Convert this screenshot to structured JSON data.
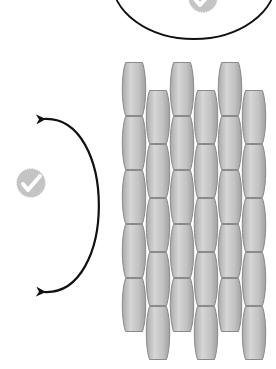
{
  "diagram": {
    "colors": {
      "background": "#ffffff",
      "cell_fill_light": "#d6d6d6",
      "cell_fill_dark": "#a9a9a9",
      "cell_stroke": "#8a8a8a",
      "badge_fill": "#c4c4c4",
      "check_mark": "#ffffff",
      "outline": "#111111"
    },
    "top_ellipse": {
      "cx": 194,
      "cy": -20,
      "rx": 82,
      "ry": 59,
      "badge": {
        "cx": 203,
        "cy": -2,
        "r": 15,
        "icon": "check-badge-icon"
      }
    },
    "left_badge": {
      "cx": 31,
      "cy": 183,
      "r": 15,
      "icon": "check-badge-icon"
    },
    "curved_arrow": {
      "start": [
        40,
        119
      ],
      "end": [
        40,
        292
      ],
      "bulge_x": 98,
      "heads": "both",
      "icon": "double-headed-curved-arrow-icon"
    },
    "cell_grid": {
      "cell_width": 24,
      "cell_height": 54,
      "columns": [
        {
          "x": 122,
          "top": 62,
          "count": 5
        },
        {
          "x": 146,
          "top": 90,
          "count": 5
        },
        {
          "x": 170,
          "top": 62,
          "count": 5
        },
        {
          "x": 194,
          "top": 90,
          "count": 5
        },
        {
          "x": 218,
          "top": 62,
          "count": 5
        },
        {
          "x": 242,
          "top": 90,
          "count": 5
        }
      ]
    }
  }
}
